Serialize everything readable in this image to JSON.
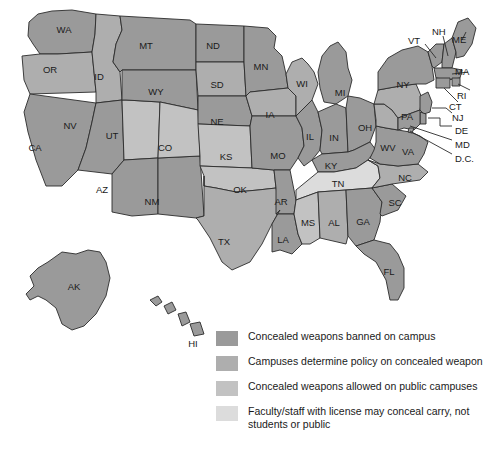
{
  "figure": {
    "type": "choropleth-map",
    "region": "United States",
    "background_color": "#ffffff",
    "border_color": "#2b2b2b"
  },
  "legend": {
    "items": [
      {
        "label": "Concealed weapons banned on campus",
        "color": "#9a9a9a",
        "key": "banned"
      },
      {
        "label": "Campuses determine policy on concealed weapon",
        "color": "#aeaeae",
        "key": "campus-policy"
      },
      {
        "label": "Concealed weapons allowed on public campuses",
        "color": "#c2c2c2",
        "key": "allowed-public"
      },
      {
        "label": "Faculty/staff with license may conceal carry, not students or public",
        "color": "#dcdcdc",
        "key": "faculty-staff"
      }
    ]
  },
  "map_data": {
    "categories": {
      "banned": "#9a9a9a",
      "campus-policy": "#aeaeae",
      "allowed-public": "#c2c2c2",
      "faculty-staff": "#dcdcdc"
    },
    "states": [
      {
        "abbr": "WA",
        "category": "banned"
      },
      {
        "abbr": "OR",
        "category": "campus-policy"
      },
      {
        "abbr": "CA",
        "category": "banned"
      },
      {
        "abbr": "NV",
        "category": "banned"
      },
      {
        "abbr": "ID",
        "category": "campus-policy"
      },
      {
        "abbr": "MT",
        "category": "banned"
      },
      {
        "abbr": "WY",
        "category": "banned"
      },
      {
        "abbr": "UT",
        "category": "allowed-public"
      },
      {
        "abbr": "AZ",
        "category": "banned"
      },
      {
        "abbr": "NM",
        "category": "banned"
      },
      {
        "abbr": "CO",
        "category": "allowed-public"
      },
      {
        "abbr": "ND",
        "category": "banned"
      },
      {
        "abbr": "SD",
        "category": "campus-policy"
      },
      {
        "abbr": "NE",
        "category": "banned"
      },
      {
        "abbr": "KS",
        "category": "allowed-public"
      },
      {
        "abbr": "OK",
        "category": "allowed-public"
      },
      {
        "abbr": "TX",
        "category": "campus-policy"
      },
      {
        "abbr": "MN",
        "category": "banned"
      },
      {
        "abbr": "IA",
        "category": "campus-policy"
      },
      {
        "abbr": "MO",
        "category": "banned"
      },
      {
        "abbr": "AR",
        "category": "banned"
      },
      {
        "abbr": "LA",
        "category": "banned"
      },
      {
        "abbr": "WI",
        "category": "campus-policy"
      },
      {
        "abbr": "IL",
        "category": "banned"
      },
      {
        "abbr": "MI",
        "category": "banned"
      },
      {
        "abbr": "IN",
        "category": "banned"
      },
      {
        "abbr": "OH",
        "category": "banned"
      },
      {
        "abbr": "KY",
        "category": "banned"
      },
      {
        "abbr": "TN",
        "category": "faculty-staff"
      },
      {
        "abbr": "MS",
        "category": "allowed-public"
      },
      {
        "abbr": "AL",
        "category": "campus-policy"
      },
      {
        "abbr": "GA",
        "category": "banned"
      },
      {
        "abbr": "FL",
        "category": "banned"
      },
      {
        "abbr": "SC",
        "category": "banned"
      },
      {
        "abbr": "NC",
        "category": "campus-policy"
      },
      {
        "abbr": "VA",
        "category": "banned"
      },
      {
        "abbr": "WV",
        "category": "campus-policy"
      },
      {
        "abbr": "PA",
        "category": "campus-policy"
      },
      {
        "abbr": "NY",
        "category": "banned"
      },
      {
        "abbr": "VT",
        "category": "banned"
      },
      {
        "abbr": "NH",
        "category": "banned"
      },
      {
        "abbr": "ME",
        "category": "banned"
      },
      {
        "abbr": "MA",
        "category": "banned"
      },
      {
        "abbr": "RI",
        "category": "banned"
      },
      {
        "abbr": "CT",
        "category": "banned"
      },
      {
        "abbr": "NJ",
        "category": "banned"
      },
      {
        "abbr": "DE",
        "category": "banned"
      },
      {
        "abbr": "MD",
        "category": "banned"
      },
      {
        "abbr": "D.C.",
        "category": "banned"
      },
      {
        "abbr": "AK",
        "category": "banned"
      },
      {
        "abbr": "HI",
        "category": "banned"
      }
    ],
    "callout_labels": [
      "VT",
      "NH",
      "ME",
      "MA",
      "RI",
      "CT",
      "NJ",
      "DE",
      "MD",
      "D.C."
    ],
    "inset_labels": [
      "AK",
      "HI"
    ]
  }
}
